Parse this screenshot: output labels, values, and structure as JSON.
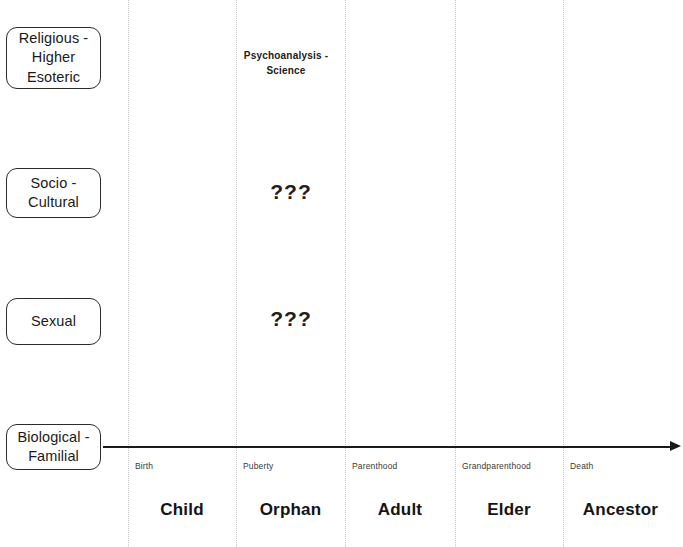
{
  "diagram": {
    "background_color": "#ffffff",
    "line_color": "#1a1a1a",
    "divider_color": "#c8c8c8",
    "levels": [
      {
        "id": "religious",
        "label": "Religious -\nHigher\nEsoteric"
      },
      {
        "id": "socio-cultural",
        "label": "Socio -\nCultural"
      },
      {
        "id": "sexual",
        "label": "Sexual"
      },
      {
        "id": "biological",
        "label": "Biological -\nFamilial"
      }
    ],
    "annotations": [
      {
        "id": "psychoanalysis",
        "text": "Psychoanalysis -\nScience",
        "row": "religious",
        "column": "orphan"
      },
      {
        "id": "unknown-socio",
        "text": "???",
        "row": "socio-cultural",
        "column": "orphan"
      },
      {
        "id": "unknown-sexual",
        "text": "???",
        "row": "sexual",
        "column": "orphan"
      }
    ],
    "timeline": {
      "events": [
        "Birth",
        "Puberty",
        "Parenthood",
        "Grandparenthood",
        "Death"
      ],
      "stages": [
        "Child",
        "Orphan",
        "Adult",
        "Elder",
        "Ancestor"
      ]
    }
  }
}
